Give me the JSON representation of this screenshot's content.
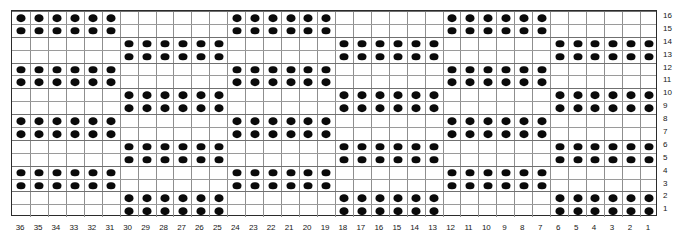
{
  "chart_data": {
    "type": "heatmap",
    "title": "",
    "xlabel": "",
    "ylabel": "",
    "grid": {
      "columns": 36,
      "rows": 16
    },
    "column_labels": [
      36,
      35,
      34,
      33,
      32,
      31,
      30,
      29,
      28,
      27,
      26,
      25,
      24,
      23,
      22,
      21,
      20,
      19,
      18,
      17,
      16,
      15,
      14,
      13,
      12,
      11,
      10,
      9,
      8,
      7,
      6,
      5,
      4,
      3,
      2,
      1
    ],
    "row_labels": [
      16,
      15,
      14,
      13,
      12,
      11,
      10,
      9,
      8,
      7,
      6,
      5,
      4,
      3,
      2,
      1
    ],
    "symbols": {
      "filled": "dot",
      "empty": "blank"
    },
    "legend": [
      {
        "symbol": "dot",
        "label": "filled stitch"
      },
      {
        "symbol": "blank",
        "label": "empty stitch"
      }
    ],
    "phase_a_columns": [
      36,
      35,
      34,
      33,
      32,
      31,
      24,
      23,
      22,
      21,
      20,
      19,
      12,
      11,
      10,
      9,
      8,
      7
    ],
    "phase_b_columns": [
      30,
      29,
      28,
      27,
      26,
      25,
      18,
      17,
      16,
      15,
      14,
      13,
      6,
      5,
      4,
      3,
      2,
      1
    ],
    "rows_phase_a": [
      3,
      4,
      7,
      8,
      11,
      12,
      15,
      16
    ],
    "rows_phase_b": [
      1,
      2,
      5,
      6,
      9,
      10,
      13,
      14
    ],
    "repeat": {
      "row_repeat": 4,
      "column_repeat": 12
    },
    "matrix_top_to_bottom": [
      [
        1,
        1,
        1,
        1,
        1,
        1,
        0,
        0,
        0,
        0,
        0,
        0,
        1,
        1,
        1,
        1,
        1,
        1,
        0,
        0,
        0,
        0,
        0,
        0,
        1,
        1,
        1,
        1,
        1,
        1,
        0,
        0,
        0,
        0,
        0,
        0
      ],
      [
        1,
        1,
        1,
        1,
        1,
        1,
        0,
        0,
        0,
        0,
        0,
        0,
        1,
        1,
        1,
        1,
        1,
        1,
        0,
        0,
        0,
        0,
        0,
        0,
        1,
        1,
        1,
        1,
        1,
        1,
        0,
        0,
        0,
        0,
        0,
        0
      ],
      [
        0,
        0,
        0,
        0,
        0,
        0,
        1,
        1,
        1,
        1,
        1,
        1,
        0,
        0,
        0,
        0,
        0,
        0,
        1,
        1,
        1,
        1,
        1,
        1,
        0,
        0,
        0,
        0,
        0,
        0,
        1,
        1,
        1,
        1,
        1,
        1
      ],
      [
        0,
        0,
        0,
        0,
        0,
        0,
        1,
        1,
        1,
        1,
        1,
        1,
        0,
        0,
        0,
        0,
        0,
        0,
        1,
        1,
        1,
        1,
        1,
        1,
        0,
        0,
        0,
        0,
        0,
        0,
        1,
        1,
        1,
        1,
        1,
        1
      ],
      [
        1,
        1,
        1,
        1,
        1,
        1,
        0,
        0,
        0,
        0,
        0,
        0,
        1,
        1,
        1,
        1,
        1,
        1,
        0,
        0,
        0,
        0,
        0,
        0,
        1,
        1,
        1,
        1,
        1,
        1,
        0,
        0,
        0,
        0,
        0,
        0
      ],
      [
        1,
        1,
        1,
        1,
        1,
        1,
        0,
        0,
        0,
        0,
        0,
        0,
        1,
        1,
        1,
        1,
        1,
        1,
        0,
        0,
        0,
        0,
        0,
        0,
        1,
        1,
        1,
        1,
        1,
        1,
        0,
        0,
        0,
        0,
        0,
        0
      ],
      [
        0,
        0,
        0,
        0,
        0,
        0,
        1,
        1,
        1,
        1,
        1,
        1,
        0,
        0,
        0,
        0,
        0,
        0,
        1,
        1,
        1,
        1,
        1,
        1,
        0,
        0,
        0,
        0,
        0,
        0,
        1,
        1,
        1,
        1,
        1,
        1
      ],
      [
        0,
        0,
        0,
        0,
        0,
        0,
        1,
        1,
        1,
        1,
        1,
        1,
        0,
        0,
        0,
        0,
        0,
        0,
        1,
        1,
        1,
        1,
        1,
        1,
        0,
        0,
        0,
        0,
        0,
        0,
        1,
        1,
        1,
        1,
        1,
        1
      ],
      [
        1,
        1,
        1,
        1,
        1,
        1,
        0,
        0,
        0,
        0,
        0,
        0,
        1,
        1,
        1,
        1,
        1,
        1,
        0,
        0,
        0,
        0,
        0,
        0,
        1,
        1,
        1,
        1,
        1,
        1,
        0,
        0,
        0,
        0,
        0,
        0
      ],
      [
        1,
        1,
        1,
        1,
        1,
        1,
        0,
        0,
        0,
        0,
        0,
        0,
        1,
        1,
        1,
        1,
        1,
        1,
        0,
        0,
        0,
        0,
        0,
        0,
        1,
        1,
        1,
        1,
        1,
        1,
        0,
        0,
        0,
        0,
        0,
        0
      ],
      [
        0,
        0,
        0,
        0,
        0,
        0,
        1,
        1,
        1,
        1,
        1,
        1,
        0,
        0,
        0,
        0,
        0,
        0,
        1,
        1,
        1,
        1,
        1,
        1,
        0,
        0,
        0,
        0,
        0,
        0,
        1,
        1,
        1,
        1,
        1,
        1
      ],
      [
        0,
        0,
        0,
        0,
        0,
        0,
        1,
        1,
        1,
        1,
        1,
        1,
        0,
        0,
        0,
        0,
        0,
        0,
        1,
        1,
        1,
        1,
        1,
        1,
        0,
        0,
        0,
        0,
        0,
        0,
        1,
        1,
        1,
        1,
        1,
        1
      ],
      [
        1,
        1,
        1,
        1,
        1,
        1,
        0,
        0,
        0,
        0,
        0,
        0,
        1,
        1,
        1,
        1,
        1,
        1,
        0,
        0,
        0,
        0,
        0,
        0,
        1,
        1,
        1,
        1,
        1,
        1,
        0,
        0,
        0,
        0,
        0,
        0
      ],
      [
        1,
        1,
        1,
        1,
        1,
        1,
        0,
        0,
        0,
        0,
        0,
        0,
        1,
        1,
        1,
        1,
        1,
        1,
        0,
        0,
        0,
        0,
        0,
        0,
        1,
        1,
        1,
        1,
        1,
        1,
        0,
        0,
        0,
        0,
        0,
        0
      ],
      [
        0,
        0,
        0,
        0,
        0,
        0,
        1,
        1,
        1,
        1,
        1,
        1,
        0,
        0,
        0,
        0,
        0,
        0,
        1,
        1,
        1,
        1,
        1,
        1,
        0,
        0,
        0,
        0,
        0,
        0,
        1,
        1,
        1,
        1,
        1,
        1
      ],
      [
        0,
        0,
        0,
        0,
        0,
        0,
        1,
        1,
        1,
        1,
        1,
        1,
        0,
        0,
        0,
        0,
        0,
        0,
        1,
        1,
        1,
        1,
        1,
        1,
        0,
        0,
        0,
        0,
        0,
        0,
        1,
        1,
        1,
        1,
        1,
        1
      ]
    ],
    "colors": {
      "dot": "#0a0a0a",
      "grid_line": "#8f8f8f",
      "grid_border": "#2b2b2b",
      "background": "#ffffff",
      "label_text": "#171717"
    }
  }
}
